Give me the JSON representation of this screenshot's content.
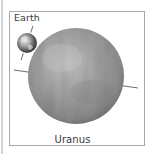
{
  "figure": {
    "type": "planet-size-comparison",
    "labels": {
      "small_planet": "Earth",
      "large_planet": "Uranus"
    },
    "planets": [
      {
        "name": "Earth",
        "center": [
          27,
          43
        ],
        "radius": 10,
        "axis_tilt_deg": 23,
        "colors": {
          "base": "#8a8a8a",
          "light": "#e8e8e8",
          "dark": "#2e2e2e"
        }
      },
      {
        "name": "Uranus",
        "center": [
          76,
          76
        ],
        "radius": 48,
        "axis_tilt_deg": 98,
        "colors": {
          "base": "#9a9a9a",
          "light": "#c9c9c9",
          "dark": "#6e6e6e"
        }
      }
    ],
    "frame_border_color": "#a8a8a8",
    "axis_line_color": "#5a5a5a"
  }
}
